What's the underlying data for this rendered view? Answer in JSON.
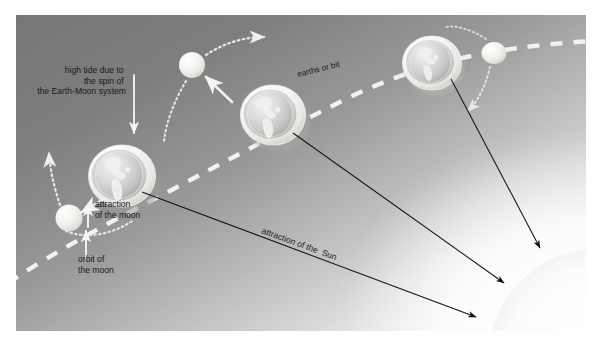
{
  "figure": {
    "canvas": {
      "width": 601,
      "height": 348,
      "inset_left": 16,
      "inset_top": 15,
      "inner_width": 570,
      "inner_height": 316
    },
    "colors": {
      "page_background": "#ffffff",
      "sky_dark": "#7b7b7b",
      "sky_mid": "#a8a8a8",
      "sky_light": "#e8e8e8",
      "sky_white": "#fbfbfb",
      "orbit_dash": "#f2f2f2",
      "moon_body": "#e9e9e5",
      "earth_shell": "#f4f4f2",
      "earth_ocean": "#d9d9d9",
      "earth_land": "#f0f0ee",
      "arrow_black": "#121212",
      "arrow_white": "#f4f4f4",
      "label_text": "#1a1a1a",
      "sun_glow": "#fdfdfd"
    }
  },
  "labels": {
    "high_tide": {
      "lines": [
        "high tide due to",
        "the spin of",
        "the Earth-Moon system"
      ],
      "align": "right",
      "font_size": 8.5
    },
    "attraction_of_the_moon": {
      "lines": [
        "attraction",
        "of the moon"
      ],
      "align": "left",
      "font_size": 8.5
    },
    "orbit_of_the_moon": {
      "lines": [
        "orbit of",
        "the moon"
      ],
      "align": "left",
      "font_size": 8.5
    },
    "earths_orbit": {
      "text": "earths or bit",
      "rotation": -14,
      "font_size": 8
    },
    "attraction_of_the_sun": {
      "text": "attraction of the  Sun",
      "rotation": 20,
      "font_size": 8.5
    }
  },
  "bodies": {
    "earths": [
      {
        "name": "earth-left",
        "cx": 106,
        "cy": 161,
        "r": 30,
        "label": "Earth (position 1)"
      },
      {
        "name": "earth-middle",
        "cx": 257,
        "cy": 100,
        "r": 30,
        "label": "Earth (position 2)"
      },
      {
        "name": "earth-right",
        "cx": 416,
        "cy": 48,
        "r": 27,
        "label": "Earth (position 3)"
      }
    ],
    "moons": [
      {
        "name": "moon-left",
        "cx": 53,
        "cy": 203,
        "r": 13,
        "label": "Moon (position 1)"
      },
      {
        "name": "moon-middle",
        "cx": 176,
        "cy": 50,
        "r": 13,
        "label": "Moon (position 2)"
      },
      {
        "name": "moon-right",
        "cx": 478,
        "cy": 38,
        "r": 12,
        "label": "Moon (position 3)"
      }
    ],
    "sun": {
      "name": "sun",
      "cx": 600,
      "cy": 360,
      "r": 110,
      "label": "The Sun"
    }
  },
  "arrows": {
    "sun_attraction": [
      {
        "name": "sun-arrow-from-earth-left",
        "x1": 125,
        "y1": 176,
        "x2": 473,
        "y2": 309
      },
      {
        "name": "sun-arrow-from-earth-middle",
        "x1": 276,
        "y1": 117,
        "x2": 501,
        "y2": 275
      },
      {
        "name": "sun-arrow-from-earth-right",
        "x1": 434,
        "y1": 63,
        "x2": 537,
        "y2": 240
      }
    ],
    "moon_attraction": [
      {
        "name": "moon-attraction-arrow-left",
        "label": "attraction of the moon"
      },
      {
        "name": "moon-attraction-arrow-middle",
        "label": "attraction of the moon"
      }
    ],
    "moon_orbit": [
      {
        "name": "moon-orbit-arrow-left",
        "label": "orbit of the moon"
      },
      {
        "name": "moon-orbit-arrow-middle",
        "label": "orbit of the moon"
      },
      {
        "name": "moon-orbit-arrow-right",
        "label": "orbit of the moon"
      }
    ],
    "tide_pointer": {
      "name": "high-tide-pointer-arrow",
      "label": "points at tidal bulge"
    }
  },
  "orbit_path": {
    "name": "earth-orbit-dashed-line",
    "style": "dashed",
    "label": "earths or bit"
  }
}
